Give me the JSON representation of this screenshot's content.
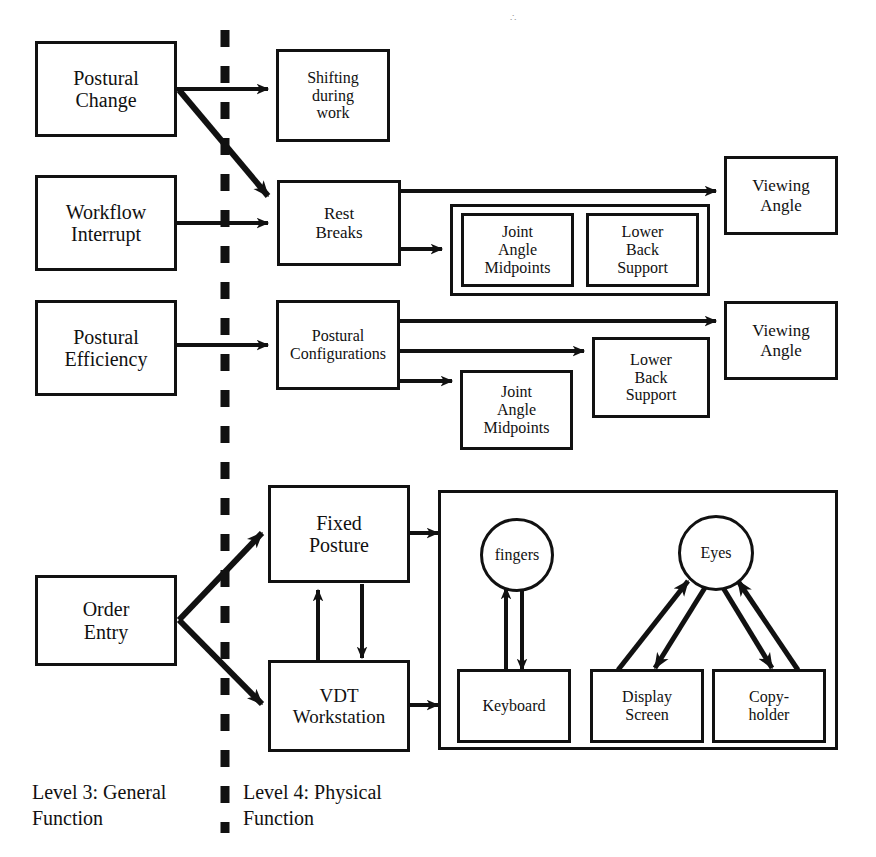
{
  "diagram": {
    "divider": {
      "label": "dashed-vertical-divider"
    },
    "captions": [
      {
        "name": "level-3-caption",
        "text": "Level 3:  General\nFunction"
      },
      {
        "name": "level-4-caption",
        "text": "Level 4:  Physical\nFunction"
      }
    ],
    "nodes": {
      "postural_change": "Postural\nChange",
      "workflow_interrupt": "Workflow\nInterrupt",
      "postural_efficiency": "Postural\nEfficiency",
      "order_entry": "Order\nEntry",
      "shifting_during_work": "Shifting\nduring\nwork",
      "rest_breaks": "Rest\nBreaks",
      "joint_angle_midpoints_top": "Joint\nAngle\nMidpoints",
      "lower_back_support_top": "Lower\nBack\nSupport",
      "viewing_angle_top": "Viewing\nAngle",
      "postural_configurations": "Postural\nConfigurations",
      "viewing_angle_mid": "Viewing\nAngle",
      "lower_back_support_mid": "Lower\nBack\nSupport",
      "joint_angle_midpoints_mid": "Joint\nAngle\nMidpoints",
      "fixed_posture": "Fixed\nPosture",
      "vdt_workstation": "VDT\nWorkstation",
      "fingers": "fingers",
      "eyes": "Eyes",
      "keyboard": "Keyboard",
      "display_screen": "Display\nScreen",
      "copyholder": "Copy-\nholder"
    },
    "colors": {
      "stroke": "#111111",
      "background": "#ffffff",
      "speck": "#9a9a9a"
    },
    "edges": [
      {
        "from": "postural_change",
        "to": "shifting_during_work"
      },
      {
        "from": "postural_change",
        "to": "rest_breaks"
      },
      {
        "from": "workflow_interrupt",
        "to": "rest_breaks"
      },
      {
        "from": "rest_breaks",
        "to": "viewing_angle_top"
      },
      {
        "from": "rest_breaks",
        "to": "joint_angle_midpoints_top"
      },
      {
        "from": "postural_efficiency",
        "to": "postural_configurations"
      },
      {
        "from": "postural_configurations",
        "to": "viewing_angle_mid"
      },
      {
        "from": "postural_configurations",
        "to": "lower_back_support_mid"
      },
      {
        "from": "postural_configurations",
        "to": "joint_angle_midpoints_mid"
      },
      {
        "from": "order_entry",
        "to": "fixed_posture"
      },
      {
        "from": "order_entry",
        "to": "vdt_workstation"
      },
      {
        "from": "fixed_posture",
        "to": "vdt_workstation"
      },
      {
        "from": "vdt_workstation",
        "to": "fixed_posture"
      },
      {
        "from": "fixed_posture",
        "to": "physical_panel"
      },
      {
        "from": "vdt_workstation",
        "to": "physical_panel"
      },
      {
        "from": "fingers",
        "to": "keyboard"
      },
      {
        "from": "keyboard",
        "to": "fingers"
      },
      {
        "from": "display_screen",
        "to": "eyes"
      },
      {
        "from": "eyes",
        "to": "display_screen"
      },
      {
        "from": "copyholder",
        "to": "eyes"
      },
      {
        "from": "eyes",
        "to": "copyholder"
      }
    ]
  }
}
